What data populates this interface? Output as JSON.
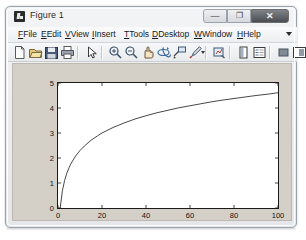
{
  "window": {
    "title": "Figure 1",
    "icon": "matlab-figure-icon",
    "controls": [
      {
        "name": "minimize",
        "glyph": "—"
      },
      {
        "name": "maximize",
        "glyph": "❐"
      },
      {
        "name": "close",
        "glyph": "✕"
      }
    ]
  },
  "menubar": {
    "items": [
      {
        "label": "File",
        "mnemonic": "F",
        "x": 10
      },
      {
        "label": "Edit",
        "mnemonic": "E",
        "x": 33
      },
      {
        "label": "View",
        "mnemonic": "V",
        "x": 57
      },
      {
        "label": "Insert",
        "mnemonic": "I",
        "x": 84
      },
      {
        "label": "Tools",
        "mnemonic": "T",
        "x": 116
      },
      {
        "label": "Desktop",
        "mnemonic": "D",
        "x": 144
      },
      {
        "label": "Window",
        "mnemonic": "W",
        "x": 186
      },
      {
        "label": "Help",
        "mnemonic": "H",
        "x": 229
      }
    ],
    "overflow": "overflow-chevron"
  },
  "toolbar": {
    "buttons": [
      {
        "name": "new-figure-icon",
        "x": 5
      },
      {
        "name": "open-file-icon",
        "x": 21
      },
      {
        "name": "save-figure-icon",
        "x": 37
      },
      {
        "name": "print-figure-icon",
        "x": 53
      },
      {
        "name": "edit-pointer-icon",
        "x": 77
      },
      {
        "name": "zoom-in-icon",
        "x": 101
      },
      {
        "name": "zoom-out-icon",
        "x": 117
      },
      {
        "name": "pan-icon",
        "x": 133
      },
      {
        "name": "rotate-3d-icon",
        "x": 149
      },
      {
        "name": "data-cursor-icon",
        "x": 165
      },
      {
        "name": "brush-data-icon",
        "x": 181
      },
      {
        "name": "link-plot-icon",
        "x": 205
      },
      {
        "name": "insert-colorbar-icon",
        "x": 229
      },
      {
        "name": "insert-legend-icon",
        "x": 245
      },
      {
        "name": "hide-plot-tools-icon",
        "x": 269
      },
      {
        "name": "show-plot-tools-icon",
        "x": 285
      }
    ],
    "separators": [
      70,
      94,
      198,
      222,
      262
    ],
    "brush_caret_x": 194
  },
  "chart_data": {
    "type": "line",
    "title": "",
    "xlabel": "",
    "ylabel": "",
    "xlim": [
      0,
      100
    ],
    "ylim": [
      0,
      5
    ],
    "xticks": [
      0,
      20,
      40,
      60,
      80,
      100
    ],
    "yticks": [
      0,
      1,
      2,
      3,
      4,
      5
    ],
    "grid": false,
    "legend": null,
    "line_color": "#333333",
    "background": "#ffffff",
    "figure_background": "#d4d0c8",
    "series": [
      {
        "name": "log(x)",
        "x": [
          1,
          2,
          3,
          4,
          5,
          6,
          8,
          10,
          12,
          15,
          18,
          20,
          25,
          30,
          35,
          40,
          45,
          50,
          55,
          60,
          65,
          70,
          75,
          80,
          85,
          90,
          95,
          100
        ],
        "y": [
          0.0,
          0.69,
          1.1,
          1.39,
          1.61,
          1.79,
          2.08,
          2.3,
          2.48,
          2.71,
          2.89,
          3.0,
          3.22,
          3.4,
          3.56,
          3.69,
          3.81,
          3.91,
          4.01,
          4.09,
          4.17,
          4.25,
          4.32,
          4.38,
          4.44,
          4.5,
          4.55,
          4.61
        ]
      }
    ]
  }
}
